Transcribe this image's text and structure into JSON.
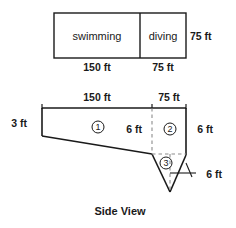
{
  "figure": {
    "caption": "Side View",
    "top_plan": {
      "rooms": [
        {
          "name": "swimming",
          "width_label": "150 ft"
        },
        {
          "name": "diving",
          "width_label": "75 ft"
        }
      ],
      "height_label": "75 ft"
    },
    "side_view": {
      "top_segments": [
        {
          "label": "150 ft"
        },
        {
          "label": "75 ft"
        }
      ],
      "left_depth_label": "3 ft",
      "interior_depth_label": "6 ft",
      "right_depth_label": "6 ft",
      "triangle_depth_label": "6 ft",
      "regions": [
        {
          "id": "1",
          "glyph": "1"
        },
        {
          "id": "2",
          "glyph": "2"
        },
        {
          "id": "3",
          "glyph": "3"
        }
      ]
    },
    "colors": {
      "stroke": "#1a1a1a",
      "dashed": "#8c8c8c",
      "background": "#ffffff"
    }
  }
}
